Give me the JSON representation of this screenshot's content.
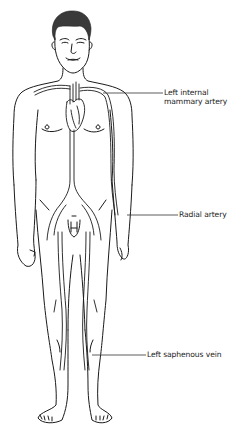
{
  "diagram": {
    "labels": [
      {
        "id": "left-internal-mammary-artery",
        "lines": [
          "Left internal",
          "mammary artery"
        ],
        "text": "Left internal mammary artery"
      },
      {
        "id": "radial-artery",
        "lines": [
          "Radial artery"
        ],
        "text": "Radial artery"
      },
      {
        "id": "left-saphenous-vein",
        "lines": [
          "Left saphenous vein"
        ],
        "text": "Left saphenous vein"
      }
    ],
    "colors": {
      "line": "#1a1a1a",
      "background": "#ffffff",
      "text": "#222222"
    }
  }
}
